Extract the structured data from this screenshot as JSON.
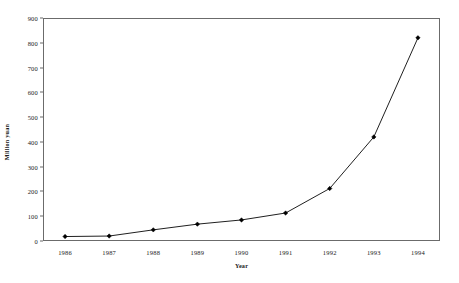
{
  "chart_data": {
    "type": "line",
    "title": "",
    "xlabel": "Year",
    "ylabel": "Million yuan",
    "categories": [
      "1986",
      "1987",
      "1988",
      "1989",
      "1990",
      "1991",
      "1992",
      "1993",
      "1994"
    ],
    "x": [
      1986,
      1987,
      1988,
      1989,
      1990,
      1991,
      1992,
      1993,
      1994
    ],
    "values": [
      18,
      20,
      45,
      68,
      85,
      113,
      212,
      420,
      820
    ],
    "series": [
      {
        "name": "Million yuan",
        "values": [
          18,
          20,
          45,
          68,
          85,
          113,
          212,
          420,
          820
        ]
      }
    ],
    "ylim": [
      0,
      900
    ],
    "yticks": [
      0,
      100,
      200,
      300,
      400,
      500,
      600,
      700,
      800,
      900
    ],
    "ytick_labels": [
      "0",
      "100",
      "200",
      "300",
      "400",
      "500",
      "600",
      "700",
      "800",
      "900"
    ],
    "xtick_labels": [
      "1986",
      "1987",
      "1988",
      "1989",
      "1990",
      "1991",
      "1992",
      "1993",
      "1994"
    ],
    "grid": false,
    "legend": "none",
    "marker": "filled-diamond",
    "line_color": "#202020",
    "marker_color": "#000000",
    "frame_color": "#6b6b6b",
    "background_color": "#ffffff"
  }
}
